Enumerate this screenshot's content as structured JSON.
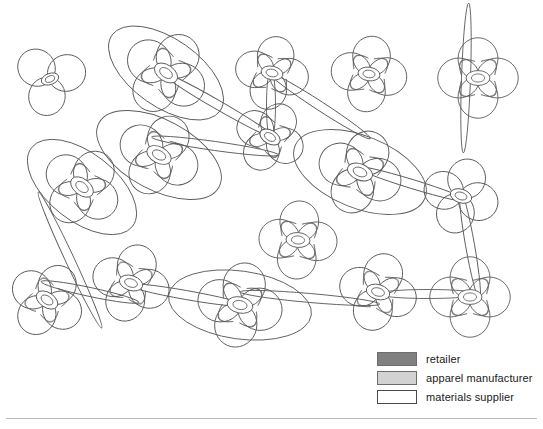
{
  "figure": {
    "type": "network-diagram",
    "background_color": "#ffffff",
    "stroke_color": "#5a5a5a"
  },
  "legend": {
    "items": [
      {
        "label": "retailer",
        "color": "#808080",
        "border": "#6d6d6d"
      },
      {
        "label": "apparel manufacturer",
        "color": "#d2d2d2",
        "border": "#6d6d6d"
      },
      {
        "label": "materials supplier",
        "color": "#ffffff",
        "border": "#4a4a4a"
      }
    ]
  },
  "chart_data": {
    "type": "scatter",
    "title": "",
    "xlabel": "",
    "ylabel": "",
    "xlim": [
      0,
      543
    ],
    "ylim": [
      0,
      429
    ],
    "grid": false,
    "legend_position": "bottom-right",
    "categories": [
      "retailer",
      "apparel manufacturer",
      "materials supplier"
    ],
    "nodes": [
      {
        "id": "n1",
        "x": 50,
        "y": 79,
        "petals": 3,
        "radius": 32,
        "rot": -20,
        "hub": 9,
        "wedge": "none"
      },
      {
        "id": "n2",
        "x": 166,
        "y": 73,
        "petals": 4,
        "radius": 37,
        "rot": 35,
        "hub": 13,
        "wedge": "retailer",
        "ring": {
          "rx": 66,
          "ry": 34,
          "rot": 35
        }
      },
      {
        "id": "n3",
        "x": 272,
        "y": 73,
        "petals": 4,
        "radius": 32,
        "rot": 12,
        "hub": 11,
        "wedge": "retailer"
      },
      {
        "id": "n4",
        "x": 369,
        "y": 74,
        "petals": 4,
        "radius": 33,
        "rot": 8,
        "hub": 11,
        "wedge": "retailer"
      },
      {
        "id": "n5",
        "x": 478,
        "y": 78,
        "petals": 4,
        "radius": 35,
        "rot": 0,
        "hub": 12,
        "wedge": "retailer"
      },
      {
        "id": "n6",
        "x": 270,
        "y": 137,
        "petals": 4,
        "radius": 31,
        "rot": 30,
        "hub": 11,
        "wedge": "retailer"
      },
      {
        "id": "n7",
        "x": 82,
        "y": 187,
        "petals": 4,
        "radius": 35,
        "rot": 38,
        "hub": 13,
        "wedge": "retailer",
        "ring": {
          "rx": 64,
          "ry": 34,
          "rot": 38
        }
      },
      {
        "id": "n8",
        "x": 159,
        "y": 155,
        "petals": 4,
        "radius": 36,
        "rot": 28,
        "hub": 13,
        "wedge": "retailer",
        "ring": {
          "rx": 68,
          "ry": 35,
          "rot": 28
        }
      },
      {
        "id": "n9",
        "x": 360,
        "y": 172,
        "petals": 4,
        "radius": 37,
        "rot": 22,
        "hub": 13,
        "wedge": "retailer",
        "ring": {
          "rx": 70,
          "ry": 36,
          "rot": 22
        }
      },
      {
        "id": "n10",
        "x": 461,
        "y": 196,
        "petals": 4,
        "radius": 33,
        "rot": 18,
        "hub": 11,
        "wedge": "none"
      },
      {
        "id": "n11",
        "x": 298,
        "y": 240,
        "petals": 4,
        "radius": 34,
        "rot": 4,
        "hub": 12,
        "wedge": "retailer"
      },
      {
        "id": "n12",
        "x": 470,
        "y": 297,
        "petals": 4,
        "radius": 35,
        "rot": 0,
        "hub": 12,
        "wedge": "retailer"
      },
      {
        "id": "n13",
        "x": 47,
        "y": 300,
        "petals": 4,
        "radius": 33,
        "rot": 34,
        "hub": 12,
        "wedge": "apparel manufacturer"
      },
      {
        "id": "n14",
        "x": 131,
        "y": 283,
        "petals": 4,
        "radius": 34,
        "rot": 18,
        "hub": 12,
        "wedge": "apparel manufacturer"
      },
      {
        "id": "n15",
        "x": 240,
        "y": 305,
        "petals": 4,
        "radius": 37,
        "rot": 12,
        "hub": 13,
        "wedge": "retailer",
        "ring": {
          "rx": 72,
          "ry": 34,
          "rot": 8
        }
      },
      {
        "id": "n16",
        "x": 378,
        "y": 292,
        "petals": 4,
        "radius": 34,
        "rot": 16,
        "hub": 12,
        "wedge": "apparel manufacturer"
      }
    ],
    "edges": [
      {
        "from": "n2",
        "to": "n6",
        "cx": 218,
        "cy": 105,
        "len": 130,
        "rot": 30
      },
      {
        "from": "n3",
        "to": "n6",
        "cx": 271,
        "cy": 105,
        "len": 72,
        "rot": 90
      },
      {
        "from": "n4",
        "to": "n6",
        "cx": 320,
        "cy": 106,
        "len": 120,
        "rot": 33
      },
      {
        "from": "n5",
        "to": "n5b",
        "cx": 466,
        "cy": 78,
        "len": 150,
        "rot": 92
      },
      {
        "from": "n6",
        "to": "n8",
        "cx": 215,
        "cy": 146,
        "len": 128,
        "rot": 8
      },
      {
        "from": "n9",
        "to": "n10",
        "cx": 412,
        "cy": 184,
        "len": 118,
        "rot": 17
      },
      {
        "from": "n10",
        "to": "n12",
        "cx": 470,
        "cy": 245,
        "len": 110,
        "rot": 80
      },
      {
        "from": "n13",
        "to": "n14",
        "cx": 90,
        "cy": 292,
        "len": 100,
        "rot": 12
      },
      {
        "from": "n13",
        "to": "n7",
        "cx": 70,
        "cy": 260,
        "len": 150,
        "rot": 65
      },
      {
        "from": "n14",
        "to": "n15",
        "cx": 186,
        "cy": 295,
        "len": 120,
        "rot": 10
      },
      {
        "from": "n15",
        "to": "n16",
        "cx": 310,
        "cy": 298,
        "len": 140,
        "rot": 5
      },
      {
        "from": "n16",
        "to": "n12",
        "cx": 428,
        "cy": 294,
        "len": 100,
        "rot": 0
      }
    ]
  }
}
